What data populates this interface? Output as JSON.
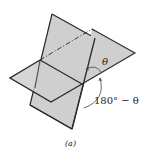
{
  "diagram": {
    "caption": "(a)",
    "angle_label": "θ",
    "supplement_label": "180° − θ",
    "colors": {
      "plane_fill": "#cfcfcf",
      "edge": "#2a2a2a",
      "arc": "#444444",
      "background": "#ffffff"
    },
    "planes": [
      {
        "name": "horizontal-plane",
        "points": "10,78 92,29 135,53 51,102"
      },
      {
        "name": "vertical-plane",
        "points": "52,14 95,38 72,129 30,105"
      }
    ]
  }
}
